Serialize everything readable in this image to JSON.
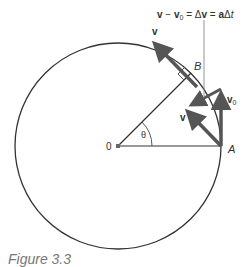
{
  "figure": {
    "caption": "Figure 3.3",
    "equation_label": {
      "v": "v",
      "minus": " − ",
      "v0": "v",
      "v0_sub": "0",
      "eq1": " = Δ",
      "dv": "v",
      "eq2": " = ",
      "a": "a",
      "delta": "Δ",
      "t": "t"
    },
    "points": {
      "center": "0",
      "A": "A",
      "B": "B"
    },
    "angle_label": "θ",
    "vectors": {
      "v_at_B": "v",
      "v_at_A": "v",
      "v0_label": "v",
      "v0_sub": "0"
    },
    "colors": {
      "circle": "#333333",
      "vector": "#555555",
      "leader": "#888888"
    }
  }
}
